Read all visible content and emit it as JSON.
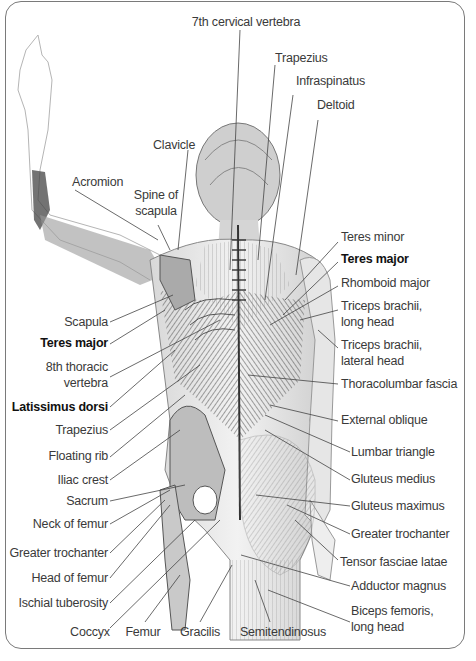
{
  "diagram": {
    "labels": {
      "top": [
        {
          "id": "c7",
          "text": "7th cervical vertebra"
        },
        {
          "id": "trapezius_top",
          "text": "Trapezius"
        },
        {
          "id": "infraspinatus",
          "text": "Infraspinatus"
        },
        {
          "id": "deltoid",
          "text": "Deltoid"
        },
        {
          "id": "clavicle",
          "text": "Clavicle"
        },
        {
          "id": "acromion",
          "text": "Acromion"
        },
        {
          "id": "spine_of_scapula",
          "text": "Spine of\nscapula",
          "line1": "Spine of",
          "line2": "scapula"
        }
      ],
      "right": [
        {
          "id": "teres_minor",
          "text": "Teres minor",
          "bold": false
        },
        {
          "id": "teres_major_r",
          "text": "Teres major",
          "bold": true
        },
        {
          "id": "rhomboid_major",
          "text": "Rhomboid major",
          "bold": false
        },
        {
          "id": "triceps_long",
          "line1": "Triceps brachii,",
          "line2": "long head",
          "bold": false
        },
        {
          "id": "triceps_lateral",
          "line1": "Triceps brachii,",
          "line2": "lateral head",
          "bold": false
        },
        {
          "id": "thoracolumbar",
          "text": "Thoracolumbar fascia",
          "bold": false
        },
        {
          "id": "external_oblique",
          "text": "External oblique",
          "bold": false
        },
        {
          "id": "lumbar_triangle",
          "text": "Lumbar triangle",
          "bold": false
        },
        {
          "id": "gluteus_medius",
          "text": "Gluteus medius",
          "bold": false
        },
        {
          "id": "gluteus_maximus",
          "text": "Gluteus maximus",
          "bold": false
        },
        {
          "id": "greater_trochanter_r",
          "text": "Greater trochanter",
          "bold": false
        },
        {
          "id": "tensor_fasciae",
          "text": "Tensor fasciae latae",
          "bold": false
        },
        {
          "id": "adductor_magnus",
          "text": "Adductor magnus",
          "bold": false
        },
        {
          "id": "biceps_femoris",
          "line1": "Biceps femoris,",
          "line2": "long head",
          "bold": false
        }
      ],
      "left": [
        {
          "id": "scapula",
          "text": "Scapula",
          "bold": false
        },
        {
          "id": "teres_major_l",
          "text": "Teres major",
          "bold": true
        },
        {
          "id": "t8",
          "line1": "8th thoracic",
          "line2": "vertebra",
          "bold": false
        },
        {
          "id": "latissimus",
          "text": "Latissimus dorsi",
          "bold": true
        },
        {
          "id": "trapezius_l",
          "text": "Trapezius",
          "bold": false
        },
        {
          "id": "floating_rib",
          "text": "Floating rib",
          "bold": false
        },
        {
          "id": "iliac_crest",
          "text": "Iliac crest",
          "bold": false
        },
        {
          "id": "sacrum",
          "text": "Sacrum",
          "bold": false
        },
        {
          "id": "neck_of_femur",
          "text": "Neck of femur",
          "bold": false
        },
        {
          "id": "greater_trochanter_l",
          "text": "Greater trochanter",
          "bold": false
        },
        {
          "id": "head_of_femur",
          "text": "Head of femur",
          "bold": false
        },
        {
          "id": "ischial_tuberosity",
          "text": "Ischial tuberosity",
          "bold": false
        }
      ],
      "bottom": [
        {
          "id": "coccyx",
          "text": "Coccyx"
        },
        {
          "id": "femur",
          "text": "Femur"
        },
        {
          "id": "gracilis",
          "text": "Gracilis"
        },
        {
          "id": "semitendinosus",
          "text": "Semitendinosus"
        }
      ]
    },
    "colors": {
      "frame": "#7a7a7a",
      "text": "#3a3a3a",
      "bold_text": "#111111",
      "leader": "#444444"
    }
  }
}
